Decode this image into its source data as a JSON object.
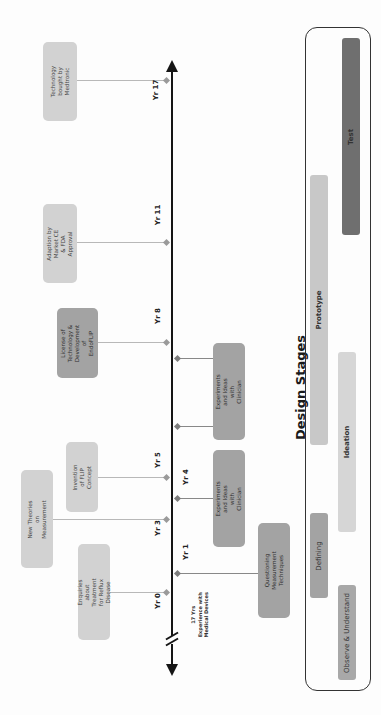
{
  "timeline": {
    "start_label": "17 Yrs\nExperience with\nMedical Devices",
    "years": [
      {
        "label": "Yr 17",
        "side": "left"
      },
      {
        "label": "Yr 11",
        "side": "left"
      },
      {
        "label": "Yr 8",
        "side": "left"
      },
      {
        "label": "Yr 5",
        "side": "left"
      },
      {
        "label": "Yr 3",
        "side": "left"
      },
      {
        "label": "Yr 0",
        "side": "left"
      },
      {
        "label": "Yr 4",
        "side": "right"
      },
      {
        "label": "Yr 1",
        "side": "right"
      }
    ]
  },
  "events_left": [
    {
      "text": "Technology bought by\nMedtronic",
      "year": "Yr 17"
    },
    {
      "text": "Adaption by Market CE\n& FDA Approval",
      "year": "Yr 11"
    },
    {
      "text": "License of\nTechnology &\nDevelopment of\nEndoFLIP",
      "year": "Yr 8"
    },
    {
      "text": "Invention of FLIP\nConcept",
      "year": "Yr 5"
    },
    {
      "text": "New Theories on\nMeasurement",
      "year": "Yr 3"
    },
    {
      "text": "Enquiries about Treatment\nfor Reflux Disease",
      "year": "Yr 0"
    }
  ],
  "events_right": [
    {
      "text": "Experiments and Ideas with\nClinician",
      "span": "Yr 5 – Yr 8"
    },
    {
      "text": "Experiments and Ideas with\nClinician",
      "span": "Yr 1 – Yr 4"
    },
    {
      "text": "Questioning Measurement\nTechniques",
      "year": "Yr 1"
    }
  ],
  "design_stages": {
    "title": "Design Stages",
    "stages": [
      {
        "label": "Observe & Understand",
        "color": "#a8a8a8"
      },
      {
        "label": "Defining",
        "color": "#a3a3a3"
      },
      {
        "label": "Ideation",
        "color": "#d6d6d6"
      },
      {
        "label": "Prototype",
        "color": "#c8c8c8"
      },
      {
        "label": "Test",
        "color": "#6f6f6f"
      }
    ]
  },
  "colors": {
    "axis": "#151515",
    "box_light": "#d2d2d2",
    "box_mid": "#a3a3a3",
    "connector": "#b8b8b8"
  }
}
